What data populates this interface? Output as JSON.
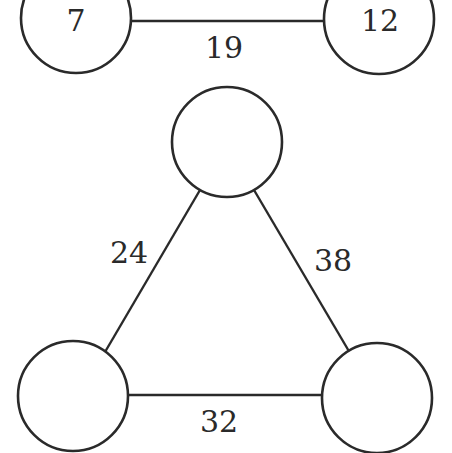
{
  "diagram": {
    "type": "graph",
    "nodes": [
      {
        "id": "a",
        "label": "7",
        "cx": 76,
        "cy": 18,
        "r": 55
      },
      {
        "id": "b",
        "label": "12",
        "cx": 379,
        "cy": 19,
        "r": 55
      },
      {
        "id": "c",
        "label": "",
        "cx": 227,
        "cy": 142,
        "r": 55
      },
      {
        "id": "d",
        "label": "",
        "cx": 73,
        "cy": 396,
        "r": 55
      },
      {
        "id": "e",
        "label": "",
        "cx": 377,
        "cy": 398,
        "r": 55
      }
    ],
    "edges": [
      {
        "from": "a",
        "to": "b",
        "label": "19"
      },
      {
        "from": "c",
        "to": "d",
        "label": "24"
      },
      {
        "from": "c",
        "to": "e",
        "label": "38"
      },
      {
        "from": "d",
        "to": "e",
        "label": "32"
      }
    ]
  },
  "colors": {
    "stroke": "#2a2a2a",
    "background": "#ffffff"
  }
}
